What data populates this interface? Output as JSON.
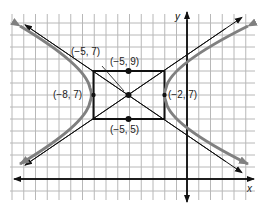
{
  "diagram": {
    "type": "hyperbola-with-asymptotes",
    "axes": {
      "x_label": "x",
      "y_label": "y"
    },
    "center": {
      "label": "(−5, 7)",
      "x": -5,
      "y": 7
    },
    "vertices": [
      {
        "label": "(−8, 7)",
        "x": -8,
        "y": 7
      },
      {
        "label": "(−2, 7)",
        "x": -2,
        "y": 7
      }
    ],
    "co_vertices": [
      {
        "label": "(−5, 9)",
        "x": -5,
        "y": 9
      },
      {
        "label": "(−5, 5)",
        "x": -5,
        "y": 5
      }
    ],
    "colors": {
      "grid": "#b8b8b8",
      "axes": "#111111",
      "hyperbola": "#808080",
      "asymptote": "#111111",
      "box": "#111111",
      "point": "#111111"
    }
  }
}
